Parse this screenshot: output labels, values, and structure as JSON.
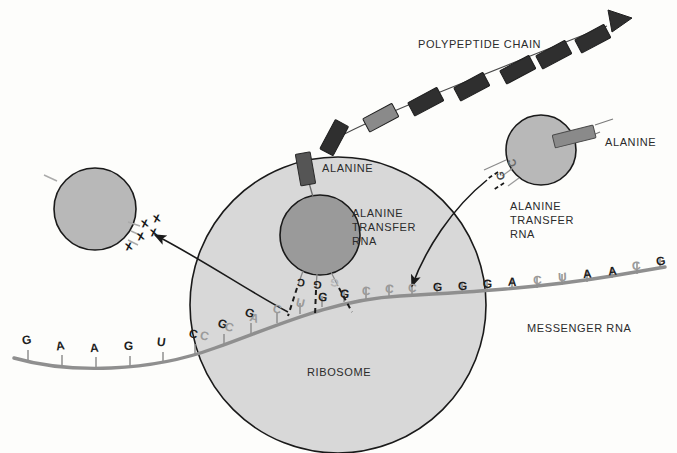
{
  "diagram": {
    "background_color": "#fdfdfb",
    "colors": {
      "ribosome_fill": "#d8d8d8",
      "trna_light_fill": "#b8b8b8",
      "trna_dark_fill": "#9a9a9a",
      "mrna_strand": "#8f8f8f",
      "amino_acid_dark": "#3a3a3a",
      "amino_acid_gray": "#8a8a8a",
      "outline": "#1a1a1a",
      "text": "#2b2b2b",
      "faint_text": "#9a9a9a"
    }
  },
  "labels": {
    "polypeptide_chain": "POLYPEPTIDE CHAIN",
    "alanine_center": "ALANINE",
    "alanine_right": "ALANINE",
    "alanine_transfer_rna_center": "ALANINE\nTRANSFER\nRNA",
    "alanine_transfer_rna_right": "ALANINE\nTRANSFER\nRNA",
    "ribosome": "RIBOSOME",
    "messenger_rna": "MESSENGER RNA"
  },
  "mrna": {
    "name": "messenger-rna-strand",
    "bases_outside_left": [
      "G",
      "A",
      "A",
      "G",
      "U",
      "C",
      "G",
      "G"
    ],
    "bases_inside_ribosome": [
      "C",
      "C",
      "A",
      "C",
      "U",
      "G"
    ],
    "bases_codon_site": [
      "G",
      "C",
      "C",
      "C"
    ],
    "bases_outside_right": [
      "G",
      "G",
      "G",
      "A",
      "C",
      "U",
      "A",
      "A",
      "C",
      "G"
    ],
    "full_sequence": [
      "G",
      "A",
      "A",
      "G",
      "U",
      "C",
      "G",
      "G",
      "C",
      "C",
      "A",
      "C",
      "U",
      "G",
      "G",
      "C",
      "C",
      "C",
      "G",
      "G",
      "A",
      "C",
      "U",
      "A",
      "A",
      "C",
      "G"
    ]
  },
  "trna_center": {
    "name": "alanine-transfer-rna-bound",
    "anticodon": [
      "C",
      "G",
      "G"
    ],
    "carries": "ALANINE",
    "state": "bound-in-ribosome"
  },
  "trna_right": {
    "name": "alanine-transfer-rna-incoming",
    "anticodon": [
      "C",
      "G"
    ],
    "carries": "ALANINE",
    "state": "incoming"
  },
  "trna_left": {
    "name": "spent-transfer-rna-departing",
    "anticodon_marks": [
      "x",
      "x",
      "x"
    ],
    "state": "departing-discharged"
  },
  "polypeptide": {
    "name": "polypeptide-chain",
    "residue_count": 8,
    "residue_shades": [
      "dark",
      "gray",
      "dark",
      "dark",
      "dark",
      "dark",
      "dark",
      "dark"
    ]
  },
  "arrows": [
    {
      "name": "arrow-trna-exit",
      "from": "ribosome",
      "to": "departing-trna"
    },
    {
      "name": "arrow-trna-entry",
      "from": "incoming-trna",
      "to": "mrna-codon-site"
    }
  ]
}
